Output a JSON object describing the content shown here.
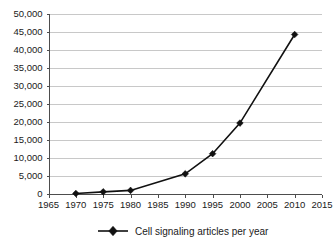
{
  "chart_data": {
    "type": "line",
    "title": "",
    "subtitle": "",
    "xlabel": "",
    "ylabel": "",
    "x": [
      1970,
      1975,
      1980,
      1990,
      1995,
      2000,
      2010
    ],
    "series": [
      {
        "name": "Cell signaling articles per year",
        "values": [
          150,
          600,
          1000,
          5600,
          11200,
          19700,
          44300
        ],
        "color": "#111111",
        "marker": "diamond"
      }
    ],
    "xlim": [
      1965,
      2015
    ],
    "ylim": [
      0,
      50000
    ],
    "xticks": [
      1965,
      1970,
      1975,
      1980,
      1985,
      1990,
      1995,
      2000,
      2005,
      2010,
      2015
    ],
    "yticks": [
      0,
      5000,
      10000,
      15000,
      20000,
      25000,
      30000,
      35000,
      40000,
      45000,
      50000
    ],
    "xtick_labels": [
      "1965",
      "1970",
      "1975",
      "1980",
      "1985",
      "1990",
      "1995",
      "2000",
      "2005",
      "2010",
      "2015"
    ],
    "ytick_labels": [
      "0",
      "5,000",
      "10,000",
      "15,000",
      "20,000",
      "25,000",
      "30,000",
      "35,000",
      "40,000",
      "45,000",
      "50,000"
    ],
    "grid": {
      "horizontal": true,
      "vertical": false,
      "color": "#c8c8c8"
    },
    "legend": {
      "position": "bottom",
      "entries": [
        {
          "label": "Cell signaling articles per year",
          "color": "#111111",
          "marker": "diamond"
        }
      ]
    },
    "annotations": []
  },
  "legend": {
    "entry_label": "Cell signaling articles per year"
  }
}
